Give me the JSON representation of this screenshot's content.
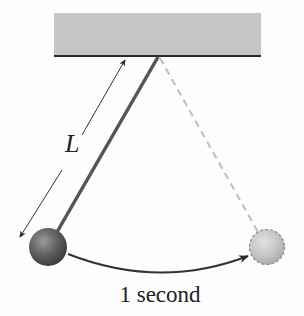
{
  "diagram": {
    "length_label": "L",
    "time_label": "1 second",
    "colors": {
      "ceiling": "#c6c6c6",
      "ceiling_edge": "#2a2a2a",
      "string": "#555555",
      "string_ghost": "#bdbdbd",
      "bob_dark": "#555555",
      "bob_light": "#bcbcbc",
      "arrow": "#333333"
    },
    "elements": [
      {
        "name": "ceiling",
        "shape": "rect"
      },
      {
        "name": "pendulum-string",
        "shape": "line"
      },
      {
        "name": "ghost-string",
        "shape": "dashed-line"
      },
      {
        "name": "bob-start",
        "shape": "circle"
      },
      {
        "name": "bob-end",
        "shape": "dashed-circle"
      },
      {
        "name": "swing-arrow",
        "shape": "curved-arrow"
      },
      {
        "name": "length-arrow",
        "shape": "arrow"
      }
    ]
  }
}
